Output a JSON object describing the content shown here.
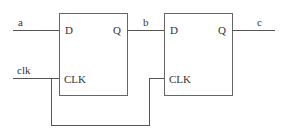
{
  "diagram": {
    "type": "circuit",
    "title": "",
    "flipflops": [
      {
        "id": "ff1",
        "pins": {
          "d": "D",
          "q": "Q",
          "clk": "CLK"
        }
      },
      {
        "id": "ff2",
        "pins": {
          "d": "D",
          "q": "Q",
          "clk": "CLK"
        }
      }
    ],
    "signals": {
      "input": "a",
      "clock": "clk",
      "middle": "b",
      "output": "c"
    },
    "connections": [
      {
        "from": "a",
        "to": "ff1.D"
      },
      {
        "from": "clk",
        "to": "ff1.CLK"
      },
      {
        "from": "ff1.Q",
        "to": "ff2.D",
        "label": "b"
      },
      {
        "from": "clk",
        "to": "ff2.CLK"
      },
      {
        "from": "ff2.Q",
        "to": "c"
      }
    ],
    "colors": {
      "wire": "#555555",
      "box": "#666666",
      "text": "#333333"
    }
  }
}
